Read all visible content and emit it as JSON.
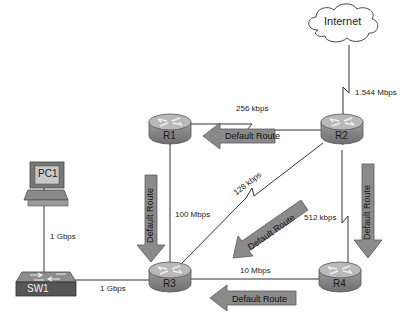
{
  "diagram": {
    "type": "network-topology",
    "nodes": {
      "internet": {
        "label": "Internet",
        "kind": "cloud"
      },
      "r1": {
        "label": "R1",
        "kind": "router"
      },
      "r2": {
        "label": "R2",
        "kind": "router"
      },
      "r3": {
        "label": "R3",
        "kind": "router"
      },
      "r4": {
        "label": "R4",
        "kind": "router"
      },
      "pc1": {
        "label": "PC1",
        "kind": "pc"
      },
      "sw1": {
        "label": "SW1",
        "kind": "switch"
      }
    },
    "links": {
      "internet_r2": {
        "from": "Internet",
        "to": "R2",
        "speed": "1.544 Mbps",
        "serial": true
      },
      "r1_r2": {
        "from": "R1",
        "to": "R2",
        "speed": "256 kbps",
        "serial": true
      },
      "r1_r3": {
        "from": "R1",
        "to": "R3",
        "speed": "100 Mbps",
        "serial": false
      },
      "r2_r3": {
        "from": "R2",
        "to": "R3",
        "speed": "128 kbps",
        "serial": true
      },
      "r2_r4": {
        "from": "R2",
        "to": "R4",
        "speed": "512 kbps",
        "serial": true
      },
      "r3_r4": {
        "from": "R3",
        "to": "R4",
        "speed": "10 Mbps",
        "serial": false
      },
      "pc1_sw1": {
        "from": "PC1",
        "to": "SW1",
        "speed": "1 Gbps",
        "serial": false
      },
      "sw1_r3": {
        "from": "SW1",
        "to": "R3",
        "speed": "1 Gbps",
        "serial": false
      }
    },
    "arrows": {
      "r2_to_r1": {
        "label": "Default Route",
        "direction": "left"
      },
      "r1_to_r3": {
        "label": "Default Route",
        "direction": "down"
      },
      "r2_to_r3": {
        "label": "Default Route",
        "direction": "down-left"
      },
      "r2_to_r4": {
        "label": "Default Route",
        "direction": "down"
      },
      "r4_to_r3": {
        "label": "Default Route",
        "direction": "left"
      }
    },
    "colors": {
      "router_top": "#b8b8b8",
      "router_body": "#8c8c8c",
      "arrow_fill": "#8a8a8a",
      "arrow_stroke": "#5a5a5a",
      "line": "#333333",
      "switch_body": "#555555"
    }
  }
}
